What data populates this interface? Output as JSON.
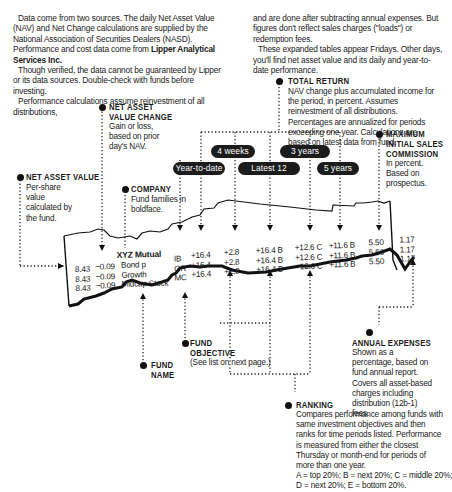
{
  "intro": {
    "left": {
      "p1": "Data come from two sources. The daily Net Asset Value (NAV) and Net Change calculations are supplied by the National Association of Securities Dealers (NASD). Performance and cost data come from",
      "p1_bold": "Lipper Analytical Services Inc.",
      "p2": "Though verified, the data cannot be guaranteed by Lipper or its data sources. Double-check with funds before investing.",
      "p3": "Performance calculations assume reinvestment of all distributions,"
    },
    "right": {
      "p1": "and are done after subtracting annual expenses. But figures don't reflect sales charges (\"loads\") or redemption fees.",
      "p2": "These expanded tables appear Fridays. Other days, you'll find net asset value and its daily and year-to-date performance."
    }
  },
  "callouts": {
    "total_return": {
      "title": "TOTAL RETURN",
      "body": "NAV change plus accumulated income for the period, in percent. Assumes reinvestment of all distributions. Percentages are annualized for periods exceeding one year. Calculations are based on latest data from fund."
    },
    "nav_change": {
      "title1": "NET ASSET",
      "title2": "VALUE CHANGE",
      "body": "Gain or loss, based on prior day's NAV."
    },
    "nav": {
      "title": "NET ASSET VALUE",
      "body": "Per-share value calculated by the fund."
    },
    "company": {
      "title": "COMPANY",
      "body": "Fund families in boldface."
    },
    "max_sales": {
      "title1": "MAXIMUM",
      "title2": "INITIAL SALES",
      "title3": "COMMISSION",
      "body": "In percent. Based on prospectus."
    },
    "fund_objective": {
      "title1": "FUND",
      "title2": "OBJECTIVE",
      "body": "(See list on next page.)"
    },
    "fund_name": {
      "title1": "FUND",
      "title2": "NAME"
    },
    "annual_expenses": {
      "title": "ANNUAL EXPENSES",
      "body": "Shown as a percentage, based on fund annual report. Covers all asset-based charges including distribution (12b-1) fees."
    },
    "ranking": {
      "title": "RANKING",
      "body": "Compares performance among funds with same investment objectives and then ranks for time periods listed. Performance is measured from either the closest Thursday or month-end for periods of more than one year.",
      "legend1": "A = top 20%; B = next 20%; C = middle 20%;",
      "legend2": "D = next 20%; E = bottom 20%."
    }
  },
  "periods": {
    "four_weeks": "4 weeks",
    "three_years": "3 years",
    "ytd": "Year-to-date",
    "latest12": "Latest 12 months",
    "five_years": "5 years"
  },
  "table": {
    "company": "XYZ Mutual",
    "rows": [
      {
        "nav": "8.43",
        "chg": "−0.09",
        "name": "Bond p",
        "obj": "IB",
        "ytd": "+16.4",
        "wk4": "+2.8",
        "m12": "+16.4 B",
        "y3": "+12.6 C",
        "y5": "+11.6 B",
        "max": "5.50",
        "exp": "1.17"
      },
      {
        "nav": "8.43",
        "chg": "−0.09",
        "name": "Growth",
        "obj": "GR",
        "ytd": "+16.4",
        "wk4": "+2.8",
        "m12": "+16.4 B",
        "y3": "+12.6 C",
        "y5": "+11.6 B",
        "max": "5.50",
        "exp": "1.17"
      },
      {
        "nav": "8.43",
        "chg": "−0.09",
        "name": "Midcap Stock",
        "obj": "MC",
        "ytd": "+16.4",
        "wk4": "+2.8",
        "m12": "+16.4 B",
        "y3": "+12.6 C",
        "y5": "+11.6 B",
        "max": "5.50",
        "exp": "1.17"
      }
    ]
  }
}
